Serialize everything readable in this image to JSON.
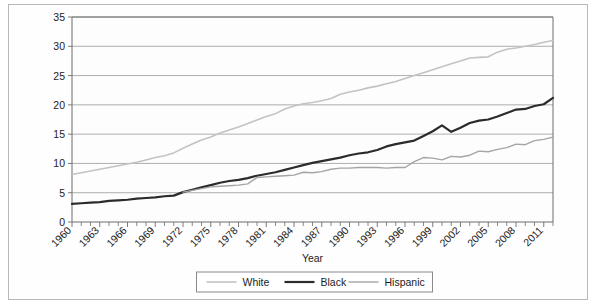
{
  "chart_data": {
    "type": "line",
    "title": "",
    "xlabel": "Year",
    "ylabel": "Educational attainment: bachelor's or greater",
    "ylabel_line1": "Educational attainment:",
    "ylabel_line2": "bachelor's or greater",
    "ylim": [
      0,
      35
    ],
    "xlim": [
      1960,
      2012
    ],
    "ytick_labels": [
      "0",
      "5",
      "10",
      "15",
      "20",
      "25",
      "30",
      "35"
    ],
    "yticks": [
      0,
      5,
      10,
      15,
      20,
      25,
      30,
      35
    ],
    "xtick_labels": [
      "1960",
      "1963",
      "1966",
      "1969",
      "1972",
      "1975",
      "1978",
      "1981",
      "1984",
      "1987",
      "1990",
      "1993",
      "1996",
      "1999",
      "2002",
      "2005",
      "2008",
      "2011"
    ],
    "xticks": [
      1960,
      1963,
      1966,
      1969,
      1972,
      1975,
      1978,
      1981,
      1984,
      1987,
      1990,
      1993,
      1996,
      1999,
      2002,
      2005,
      2008,
      2011
    ],
    "grid": "horizontal",
    "legend_position": "bottom-center",
    "x": [
      1960,
      1961,
      1962,
      1963,
      1964,
      1965,
      1966,
      1967,
      1968,
      1969,
      1970,
      1971,
      1972,
      1973,
      1974,
      1975,
      1976,
      1977,
      1978,
      1979,
      1980,
      1981,
      1982,
      1983,
      1984,
      1985,
      1986,
      1987,
      1988,
      1989,
      1990,
      1991,
      1992,
      1993,
      1994,
      1995,
      1996,
      1997,
      1998,
      1999,
      2000,
      2001,
      2002,
      2003,
      2004,
      2005,
      2006,
      2007,
      2008,
      2009,
      2010,
      2011,
      2012
    ],
    "series": [
      {
        "name": "White",
        "color": "#c3c3c3",
        "width": 1.6,
        "values": [
          8.1,
          8.4,
          8.7,
          9.0,
          9.3,
          9.6,
          9.9,
          10.2,
          10.6,
          11.0,
          11.3,
          11.8,
          12.6,
          13.3,
          14.0,
          14.5,
          15.2,
          15.7,
          16.2,
          16.8,
          17.4,
          18.0,
          18.5,
          19.3,
          19.8,
          20.2,
          20.4,
          20.7,
          21.1,
          21.8,
          22.2,
          22.5,
          22.9,
          23.2,
          23.6,
          24.0,
          24.5,
          25.0,
          25.5,
          26.0,
          26.5,
          27.0,
          27.5,
          28.0,
          28.1,
          28.2,
          29.0,
          29.5,
          29.7,
          30.0,
          30.3,
          30.7,
          31.0
        ]
      },
      {
        "name": "Black",
        "color": "#2b2b2b",
        "width": 2.2,
        "values": [
          3.1,
          3.2,
          3.3,
          3.4,
          3.6,
          3.7,
          3.8,
          4.0,
          4.1,
          4.2,
          4.4,
          4.5,
          5.1,
          5.5,
          5.9,
          6.3,
          6.7,
          7.0,
          7.2,
          7.5,
          7.9,
          8.2,
          8.5,
          8.9,
          9.3,
          9.7,
          10.1,
          10.4,
          10.7,
          11.0,
          11.4,
          11.7,
          11.9,
          12.3,
          12.9,
          13.3,
          13.6,
          13.9,
          14.7,
          15.5,
          16.5,
          15.4,
          16.1,
          16.9,
          17.3,
          17.5,
          18.0,
          18.6,
          19.2,
          19.3,
          19.8,
          20.1,
          21.2
        ]
      },
      {
        "name": "Hispanic",
        "color": "#a5a5a5",
        "width": 1.4,
        "values": [
          null,
          null,
          null,
          null,
          null,
          null,
          null,
          null,
          null,
          null,
          null,
          null,
          5.1,
          5.4,
          5.7,
          6.0,
          6.1,
          6.2,
          6.3,
          6.5,
          7.6,
          7.7,
          7.8,
          7.9,
          8.0,
          8.5,
          8.4,
          8.6,
          9.0,
          9.2,
          9.2,
          9.3,
          9.3,
          9.3,
          9.2,
          9.3,
          9.3,
          10.3,
          11.0,
          10.9,
          10.6,
          11.2,
          11.1,
          11.4,
          12.1,
          12.0,
          12.4,
          12.7,
          13.3,
          13.2,
          13.9,
          14.1,
          14.5
        ]
      }
    ]
  },
  "legend": {
    "items": [
      {
        "label": "White",
        "color": "#c3c3c3"
      },
      {
        "label": "Black",
        "color": "#2b2b2b"
      },
      {
        "label": "Hispanic",
        "color": "#a5a5a5"
      }
    ]
  }
}
